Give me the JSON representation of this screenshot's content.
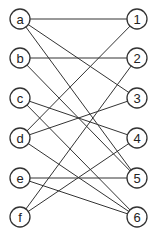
{
  "diagram": {
    "type": "bipartite-graph",
    "left_nodes": [
      {
        "id": "a",
        "label": "a",
        "x": 20,
        "y": 19
      },
      {
        "id": "b",
        "label": "b",
        "x": 20,
        "y": 58
      },
      {
        "id": "c",
        "label": "c",
        "x": 20,
        "y": 98
      },
      {
        "id": "d",
        "label": "d",
        "x": 20,
        "y": 138
      },
      {
        "id": "e",
        "label": "e",
        "x": 20,
        "y": 178
      },
      {
        "id": "f",
        "label": "f",
        "x": 20,
        "y": 217
      }
    ],
    "right_nodes": [
      {
        "id": "1",
        "label": "1",
        "x": 137,
        "y": 19
      },
      {
        "id": "2",
        "label": "2",
        "x": 137,
        "y": 58
      },
      {
        "id": "3",
        "label": "3",
        "x": 137,
        "y": 98
      },
      {
        "id": "4",
        "label": "4",
        "x": 137,
        "y": 138
      },
      {
        "id": "5",
        "label": "5",
        "x": 137,
        "y": 178
      },
      {
        "id": "6",
        "label": "6",
        "x": 137,
        "y": 217
      }
    ],
    "edges": [
      [
        "a",
        "1"
      ],
      [
        "a",
        "3"
      ],
      [
        "a",
        "5"
      ],
      [
        "b",
        "2"
      ],
      [
        "b",
        "5"
      ],
      [
        "c",
        "4"
      ],
      [
        "c",
        "6"
      ],
      [
        "d",
        "1"
      ],
      [
        "d",
        "3"
      ],
      [
        "d",
        "6"
      ],
      [
        "e",
        "5"
      ],
      [
        "e",
        "6"
      ],
      [
        "f",
        "2"
      ],
      [
        "f",
        "4"
      ]
    ],
    "node_radius": 10
  }
}
